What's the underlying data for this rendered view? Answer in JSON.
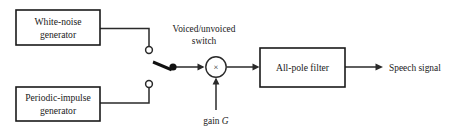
{
  "diagram": {
    "background_color": "#ffffff",
    "line_color": "#2a2a2a",
    "text_color": "#1a1a1a",
    "blocks": [
      {
        "id": "white-noise-generator",
        "line1": "White-noise",
        "line2": "generator"
      },
      {
        "id": "periodic-impulse-generator",
        "line1": "Periodic-impulse",
        "line2": "generator"
      },
      {
        "id": "all-pole-filter",
        "line1": "All-pole filter",
        "line2": ""
      }
    ],
    "labels": {
      "switch_line1": "Voiced/unvoiced",
      "switch_line2": "switch",
      "gain_text": "gain",
      "gain_symbol": "G",
      "output": "Speech signal",
      "multiplier_glyph": "×"
    }
  }
}
